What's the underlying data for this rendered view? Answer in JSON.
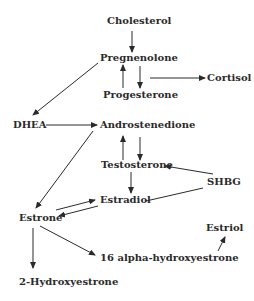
{
  "diagram": {
    "type": "pathway",
    "title": "",
    "nodes": [
      {
        "id": "cholesterol",
        "label": "Cholesterol"
      },
      {
        "id": "pregnenolone",
        "label": "Pregnenolone"
      },
      {
        "id": "progesterone",
        "label": "Progesterone"
      },
      {
        "id": "cortisol",
        "label": "Cortisol"
      },
      {
        "id": "dhea",
        "label": "DHEA"
      },
      {
        "id": "androstenedione",
        "label": "Androstenedione"
      },
      {
        "id": "testosterone",
        "label": "Testosterone"
      },
      {
        "id": "shbg",
        "label": "SHBG"
      },
      {
        "id": "estradiol",
        "label": "Estradiol"
      },
      {
        "id": "estrone",
        "label": "Estrone"
      },
      {
        "id": "estriol",
        "label": "Estriol"
      },
      {
        "id": "alpha16",
        "label": "16 alpha-hydroxyestrone"
      },
      {
        "id": "hydroxy2",
        "label": "2-Hydroxyestrone"
      }
    ],
    "edges": [
      {
        "from": "cholesterol",
        "to": "pregnenolone",
        "arrow": true
      },
      {
        "from": "pregnenolone",
        "to": "progesterone",
        "arrow": true
      },
      {
        "from": "progesterone",
        "to": "pregnenolone",
        "arrow": true
      },
      {
        "from": "pregnenolone",
        "to": "cortisol",
        "arrow": true
      },
      {
        "from": "pregnenolone",
        "to": "dhea",
        "arrow": true
      },
      {
        "from": "dhea",
        "to": "androstenedione",
        "arrow": true
      },
      {
        "from": "androstenedione",
        "to": "testosterone",
        "arrow": true
      },
      {
        "from": "testosterone",
        "to": "androstenedione",
        "arrow": true
      },
      {
        "from": "shbg",
        "to": "testosterone",
        "arrow": true
      },
      {
        "from": "shbg",
        "to": "estradiol",
        "arrow": false
      },
      {
        "from": "testosterone",
        "to": "estradiol",
        "arrow": true
      },
      {
        "from": "androstenedione",
        "to": "estrone",
        "arrow": true
      },
      {
        "from": "estrone",
        "to": "estradiol",
        "arrow": true
      },
      {
        "from": "estradiol",
        "to": "estrone",
        "arrow": true
      },
      {
        "from": "estrone",
        "to": "hydroxy2",
        "arrow": true
      },
      {
        "from": "estrone",
        "to": "alpha16",
        "arrow": true
      },
      {
        "from": "alpha16",
        "to": "estriol",
        "arrow": true
      }
    ]
  }
}
